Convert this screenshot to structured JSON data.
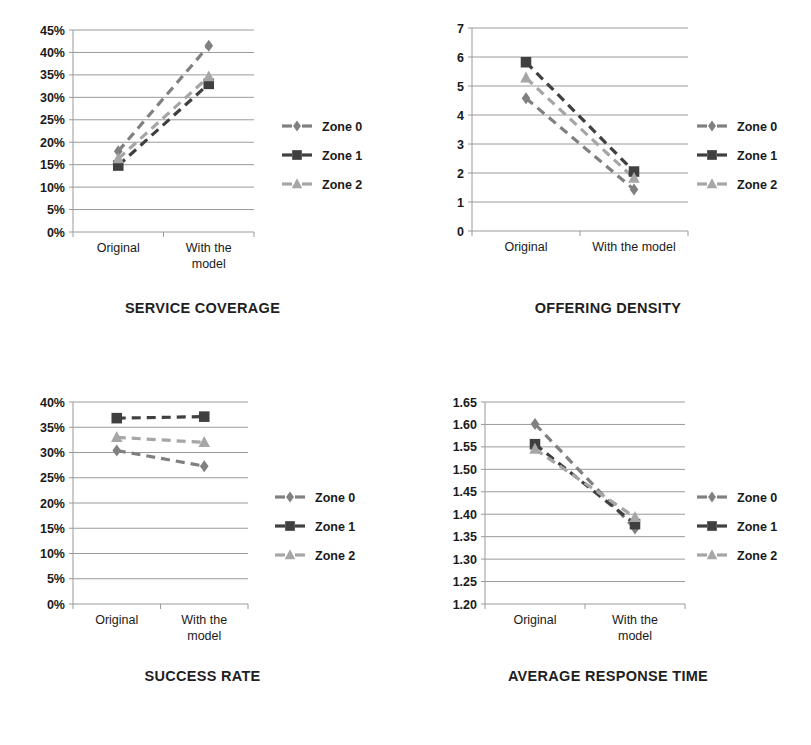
{
  "page": {
    "background": "#ffffff",
    "series_colors": {
      "zone0": "#808080",
      "zone1": "#404040",
      "zone2": "#a6a6a6"
    },
    "series_markers": {
      "zone0": "diamond",
      "zone1": "square",
      "zone2": "triangle"
    },
    "legend_labels": [
      "Zone 0",
      "Zone 1",
      "Zone 2"
    ],
    "categories": [
      "Original",
      "With the model"
    ]
  },
  "charts": [
    {
      "id": "service-coverage",
      "title": "SERVICE COVERAGE",
      "xlabels": [
        "Original",
        "With the\nmodel"
      ],
      "xlabel_line1": [
        "Original",
        "With the"
      ],
      "xlabel_line2": [
        "",
        "model"
      ],
      "yticks": [
        "0%",
        "5%",
        "10%",
        "15%",
        "20%",
        "25%",
        "30%",
        "35%",
        "40%",
        "45%"
      ],
      "ymin": 0,
      "ymax": 45,
      "ystep": 5,
      "series": [
        {
          "name": "Zone 0",
          "values": [
            18.0,
            41.5
          ]
        },
        {
          "name": "Zone 1",
          "values": [
            14.8,
            33.0
          ]
        },
        {
          "name": "Zone 2",
          "values": [
            16.3,
            34.6
          ]
        }
      ]
    },
    {
      "id": "offering-density",
      "title": "OFFERING DENSITY",
      "xlabels": [
        "Original",
        "With the model"
      ],
      "xlabel_line1": [
        "Original",
        "With the model"
      ],
      "xlabel_line2": [
        "",
        ""
      ],
      "yticks": [
        "0",
        "1",
        "2",
        "3",
        "4",
        "5",
        "6",
        "7"
      ],
      "ymin": 0,
      "ymax": 7,
      "ystep": 1,
      "series": [
        {
          "name": "Zone 0",
          "values": [
            4.58,
            1.43
          ]
        },
        {
          "name": "Zone 1",
          "values": [
            5.82,
            2.05
          ]
        },
        {
          "name": "Zone 2",
          "values": [
            5.28,
            1.82
          ]
        }
      ]
    },
    {
      "id": "success-rate",
      "title": "SUCCESS RATE",
      "xlabels": [
        "Original",
        "With the\nmodel"
      ],
      "xlabel_line1": [
        "Original",
        "With the"
      ],
      "xlabel_line2": [
        "",
        "model"
      ],
      "yticks": [
        "0%",
        "5%",
        "10%",
        "15%",
        "20%",
        "25%",
        "30%",
        "35%",
        "40%"
      ],
      "ymin": 0,
      "ymax": 40,
      "ystep": 5,
      "series": [
        {
          "name": "Zone 0",
          "values": [
            30.4,
            27.3
          ]
        },
        {
          "name": "Zone 1",
          "values": [
            36.8,
            37.1
          ]
        },
        {
          "name": "Zone 2",
          "values": [
            33.0,
            32.0
          ]
        }
      ]
    },
    {
      "id": "average-response-time",
      "title": "AVERAGE RESPONSE TIME",
      "xlabels": [
        "Original",
        "With the\nmodel"
      ],
      "xlabel_line1": [
        "Original",
        "With the"
      ],
      "xlabel_line2": [
        "",
        "model"
      ],
      "yticks": [
        "1.20",
        "1.25",
        "1.30",
        "1.35",
        "1.40",
        "1.45",
        "1.50",
        "1.55",
        "1.60",
        "1.65"
      ],
      "ymin": 1.2,
      "ymax": 1.65,
      "ystep": 0.05,
      "series": [
        {
          "name": "Zone 0",
          "values": [
            1.601,
            1.368
          ]
        },
        {
          "name": "Zone 1",
          "values": [
            1.556,
            1.378
          ]
        },
        {
          "name": "Zone 2",
          "values": [
            1.545,
            1.393
          ]
        }
      ]
    }
  ],
  "chart_data": [
    {
      "type": "line",
      "title": "SERVICE COVERAGE",
      "categories": [
        "Original",
        "With the model"
      ],
      "series": [
        {
          "name": "Zone 0",
          "values": [
            18.0,
            41.5
          ]
        },
        {
          "name": "Zone 1",
          "values": [
            14.8,
            33.0
          ]
        },
        {
          "name": "Zone 2",
          "values": [
            16.3,
            34.6
          ]
        }
      ],
      "xlabel": "",
      "ylabel": "",
      "ylim": [
        0,
        45
      ],
      "ytick_labels": [
        "0%",
        "5%",
        "10%",
        "15%",
        "20%",
        "25%",
        "30%",
        "35%",
        "40%",
        "45%"
      ],
      "grid": true,
      "legend_position": "right",
      "units": "percent"
    },
    {
      "type": "line",
      "title": "OFFERING DENSITY",
      "categories": [
        "Original",
        "With the model"
      ],
      "series": [
        {
          "name": "Zone 0",
          "values": [
            4.58,
            1.43
          ]
        },
        {
          "name": "Zone 1",
          "values": [
            5.82,
            2.05
          ]
        },
        {
          "name": "Zone 2",
          "values": [
            5.28,
            1.82
          ]
        }
      ],
      "xlabel": "",
      "ylabel": "",
      "ylim": [
        0,
        7
      ],
      "ytick_labels": [
        "0",
        "1",
        "2",
        "3",
        "4",
        "5",
        "6",
        "7"
      ],
      "grid": true,
      "legend_position": "right",
      "units": ""
    },
    {
      "type": "line",
      "title": "SUCCESS RATE",
      "categories": [
        "Original",
        "With the model"
      ],
      "series": [
        {
          "name": "Zone 0",
          "values": [
            30.4,
            27.3
          ]
        },
        {
          "name": "Zone 1",
          "values": [
            36.8,
            37.1
          ]
        },
        {
          "name": "Zone 2",
          "values": [
            33.0,
            32.0
          ]
        }
      ],
      "xlabel": "",
      "ylabel": "",
      "ylim": [
        0,
        40
      ],
      "ytick_labels": [
        "0%",
        "5%",
        "10%",
        "15%",
        "20%",
        "25%",
        "30%",
        "35%",
        "40%"
      ],
      "grid": true,
      "legend_position": "right",
      "units": "percent"
    },
    {
      "type": "line",
      "title": "AVERAGE RESPONSE TIME",
      "categories": [
        "Original",
        "With the model"
      ],
      "series": [
        {
          "name": "Zone 0",
          "values": [
            1.601,
            1.368
          ]
        },
        {
          "name": "Zone 1",
          "values": [
            1.556,
            1.378
          ]
        },
        {
          "name": "Zone 2",
          "values": [
            1.545,
            1.393
          ]
        }
      ],
      "xlabel": "",
      "ylabel": "",
      "ylim": [
        1.2,
        1.65
      ],
      "ytick_labels": [
        "1.20",
        "1.25",
        "1.30",
        "1.35",
        "1.40",
        "1.45",
        "1.50",
        "1.55",
        "1.60",
        "1.65"
      ],
      "grid": true,
      "legend_position": "right",
      "units": "seconds"
    }
  ]
}
